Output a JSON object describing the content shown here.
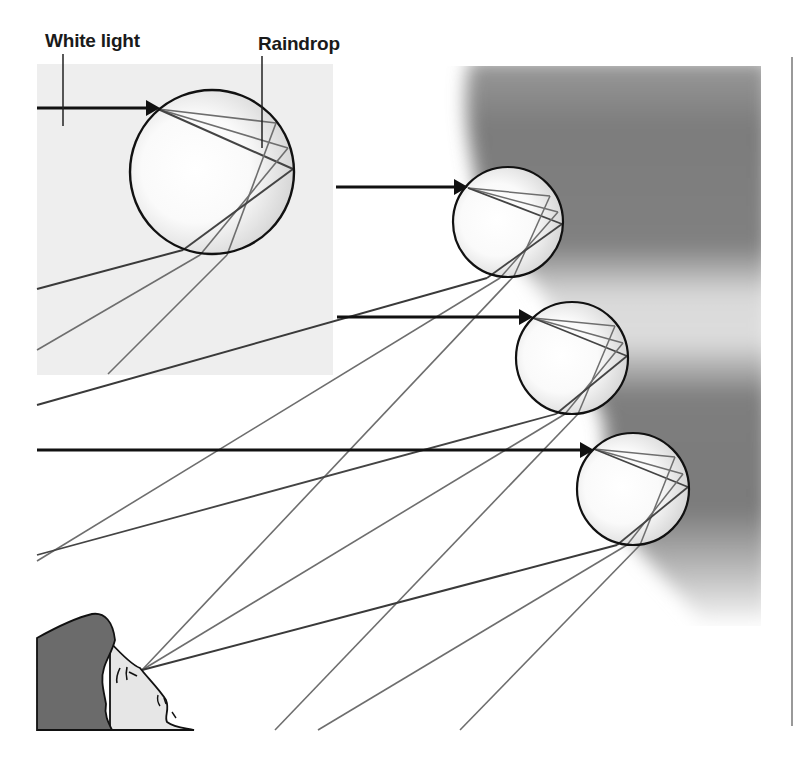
{
  "labels": {
    "white_light": "White light",
    "raindrop": "Raindrop"
  },
  "colors": {
    "background": "#ffffff",
    "inset_box": "#eeeeee",
    "sky_dark": "#7a7a7a",
    "sky_light": "#d8d8d8",
    "outline": "#111111",
    "ray": "#6e6e6e",
    "hair": "#6a6a6a",
    "skin": "#e4e4e4"
  },
  "drops": [
    {
      "name": "raindrop-magnified",
      "cx": 212,
      "cy": 172,
      "r": 82
    },
    {
      "name": "raindrop-1",
      "cx": 508,
      "cy": 222,
      "r": 55
    },
    {
      "name": "raindrop-2",
      "cx": 572,
      "cy": 358,
      "r": 56
    },
    {
      "name": "raindrop-3",
      "cx": 633,
      "cy": 489,
      "r": 56
    }
  ],
  "observer": {
    "eye_x": 142,
    "eye_y": 670
  }
}
